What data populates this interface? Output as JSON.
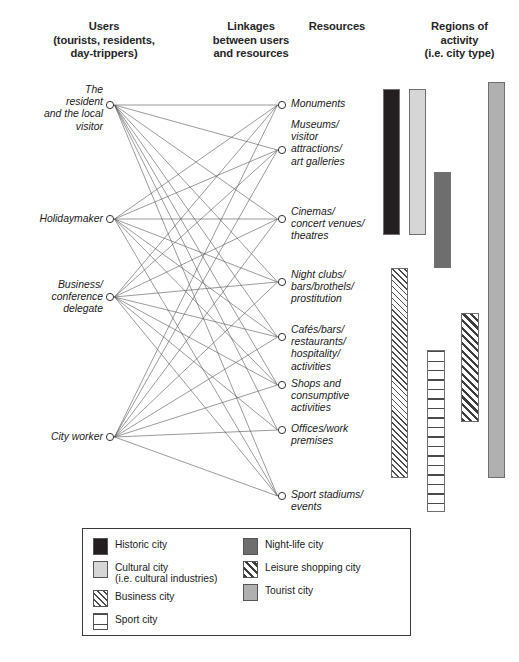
{
  "headers": {
    "users": "Users\n(tourists, residents,\nday-trippers)",
    "linkages": "Linkages\nbetween users\nand resources",
    "resources": "Resources",
    "regions": "Regions of\nactivity\n(i.e. city type)"
  },
  "users": [
    {
      "id": "u0",
      "label": "The\nresident\nand the local\nvisitor",
      "x": 110,
      "y": 105
    },
    {
      "id": "u1",
      "label": "Holidaymaker",
      "x": 110,
      "y": 219
    },
    {
      "id": "u2",
      "label": "Business/\nconference\ndelegate",
      "x": 110,
      "y": 297
    },
    {
      "id": "u3",
      "label": "City worker",
      "x": 110,
      "y": 437
    }
  ],
  "resources": [
    {
      "id": "r0",
      "label": "Monuments",
      "x": 282,
      "y": 105
    },
    {
      "id": "r1",
      "label": "Museums/\nvisitor\nattractions/\nart galleries",
      "x": 282,
      "y": 150
    },
    {
      "id": "r2",
      "label": "Cinemas/\nconcert venues/\ntheatres",
      "x": 282,
      "y": 219
    },
    {
      "id": "r3",
      "label": "Night clubs/\nbars/brothels/\nprostitution",
      "x": 282,
      "y": 282
    },
    {
      "id": "r4",
      "label": "Cafés/bars/\nrestaurants/\nhospitality/\nactivities",
      "x": 282,
      "y": 337
    },
    {
      "id": "r5",
      "label": "Shops and\nconsumptive\nactivities",
      "x": 282,
      "y": 385
    },
    {
      "id": "r6",
      "label": "Offices/work\npremises",
      "x": 282,
      "y": 430
    },
    {
      "id": "r7",
      "label": "Sport stadiums/\nevents",
      "x": 282,
      "y": 496
    }
  ],
  "links": [
    [
      "u0",
      "r0"
    ],
    [
      "u0",
      "r1"
    ],
    [
      "u0",
      "r2"
    ],
    [
      "u0",
      "r3"
    ],
    [
      "u0",
      "r4"
    ],
    [
      "u0",
      "r5"
    ],
    [
      "u0",
      "r6"
    ],
    [
      "u0",
      "r7"
    ],
    [
      "u1",
      "r0"
    ],
    [
      "u1",
      "r1"
    ],
    [
      "u1",
      "r2"
    ],
    [
      "u1",
      "r3"
    ],
    [
      "u1",
      "r4"
    ],
    [
      "u1",
      "r5"
    ],
    [
      "u1",
      "r7"
    ],
    [
      "u2",
      "r0"
    ],
    [
      "u2",
      "r1"
    ],
    [
      "u2",
      "r2"
    ],
    [
      "u2",
      "r3"
    ],
    [
      "u2",
      "r4"
    ],
    [
      "u2",
      "r5"
    ],
    [
      "u2",
      "r6"
    ],
    [
      "u2",
      "r7"
    ],
    [
      "u3",
      "r0"
    ],
    [
      "u3",
      "r1"
    ],
    [
      "u3",
      "r2"
    ],
    [
      "u3",
      "r3"
    ],
    [
      "u3",
      "r4"
    ],
    [
      "u3",
      "r5"
    ],
    [
      "u3",
      "r6"
    ],
    [
      "u3",
      "r7"
    ]
  ],
  "region_bars": [
    {
      "id": "bar-historic",
      "legend": "Historic city",
      "fill": "solid-black",
      "x": 383,
      "y": 89,
      "w": 17,
      "h": 146
    },
    {
      "id": "bar-cultural",
      "legend": "Cultural city (i.e. cultural industries)",
      "fill": "solid-ltgray",
      "x": 409,
      "y": 89,
      "w": 17,
      "h": 146
    },
    {
      "id": "bar-night-life",
      "legend": "Night-life city",
      "fill": "solid-dkgray",
      "x": 434,
      "y": 172,
      "w": 17,
      "h": 96
    },
    {
      "id": "bar-business",
      "legend": "Business city",
      "fill": "diag-fine",
      "x": 391,
      "y": 268,
      "w": 17,
      "h": 210
    },
    {
      "id": "bar-leisure-shopping",
      "legend": "Leisure shopping city",
      "fill": "diag-bold",
      "x": 461,
      "y": 313,
      "w": 18,
      "h": 109
    },
    {
      "id": "bar-sport",
      "legend": "Sport city",
      "fill": "horiz",
      "x": 427,
      "y": 350,
      "w": 18,
      "h": 162
    },
    {
      "id": "bar-tourist",
      "legend": "Tourist city",
      "fill": "solid-medgray",
      "x": 488,
      "y": 82,
      "w": 17,
      "h": 396
    }
  ],
  "legend": {
    "left_column": [
      {
        "swatch": "solid-black",
        "label": "Historic city"
      },
      {
        "swatch": "solid-ltgray",
        "label": "Cultural city\n(i.e. cultural industries)"
      },
      {
        "swatch": "diag-fine",
        "label": "Business city"
      },
      {
        "swatch": "horiz",
        "label": "Sport city"
      }
    ],
    "right_column": [
      {
        "swatch": "solid-dkgray",
        "label": "Night-life city"
      },
      {
        "swatch": "diag-bold",
        "label": "Leisure shopping city"
      },
      {
        "swatch": "solid-medgray",
        "label": "Tourist city"
      }
    ]
  },
  "bottom_caption": "",
  "colors": {
    "historic": "#231f20",
    "cultural": "#d6d6d6",
    "night_life": "#6e6e6e",
    "tourist": "#b0b0b0",
    "line": "#555555",
    "border": "#3a3a3a"
  }
}
